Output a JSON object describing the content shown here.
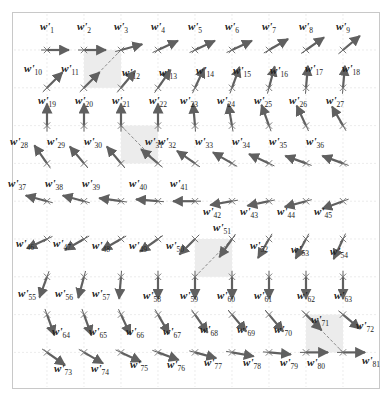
{
  "figure": {
    "colors": {
      "arrow": "#606060",
      "anchor": "#707070",
      "grid": "#e4e4e4",
      "frame": "#c8c8c8",
      "shade": "#ececec",
      "dashed": "#8a8a8a",
      "label": "#222222"
    },
    "grid": {
      "cols": 9,
      "rows": 9,
      "x0": 47,
      "y0": 50,
      "dx": 37,
      "dy": 37.8,
      "arrow_len": 22
    },
    "label_prefix": "w",
    "label_prime": "'",
    "row_angles_deg": [
      [
        0,
        0,
        -15,
        -25,
        -25,
        -25,
        -30,
        -35,
        -40
      ],
      [
        -45,
        -45,
        -50,
        -55,
        -65,
        -70,
        -75,
        -85,
        -85
      ],
      [
        -90,
        -90,
        -90,
        -90,
        -95,
        -100,
        -110,
        -115,
        -120
      ],
      [
        -125,
        -130,
        -130,
        -140,
        -145,
        -150,
        -155,
        -160,
        -160
      ],
      [
        -165,
        -165,
        -172,
        -175,
        180,
        170,
        168,
        165,
        160
      ],
      [
        155,
        150,
        150,
        145,
        135,
        125,
        120,
        118,
        115
      ],
      [
        110,
        105,
        95,
        90,
        90,
        90,
        90,
        90,
        90
      ],
      [
        70,
        70,
        65,
        60,
        55,
        50,
        50,
        45,
        40
      ],
      [
        35,
        30,
        25,
        20,
        15,
        10,
        5,
        0,
        0
      ]
    ],
    "label_offsets": [
      [
        [
          0,
          -20
        ],
        [
          0,
          -20
        ],
        [
          0,
          -20
        ],
        [
          0,
          -20
        ],
        [
          0,
          -20
        ],
        [
          0,
          -20
        ],
        [
          0,
          -20
        ],
        [
          0,
          -20
        ],
        [
          0,
          -20
        ]
      ],
      [
        [
          -14,
          -16
        ],
        [
          -14,
          -16
        ],
        [
          10,
          -12
        ],
        [
          10,
          -12
        ],
        [
          10,
          -14
        ],
        [
          10,
          -14
        ],
        [
          10,
          -14
        ],
        [
          8,
          -16
        ],
        [
          8,
          -16
        ]
      ],
      [
        [
          0,
          -22
        ],
        [
          0,
          -22
        ],
        [
          0,
          -22
        ],
        [
          0,
          -22
        ],
        [
          -6,
          -22
        ],
        [
          -6,
          -22
        ],
        [
          -6,
          -22
        ],
        [
          -8,
          -22
        ],
        [
          -8,
          -22
        ]
      ],
      [
        [
          -28,
          -18
        ],
        [
          -28,
          -18
        ],
        [
          -28,
          -18
        ],
        [
          -4,
          -18
        ],
        [
          -28,
          -18
        ],
        [
          -28,
          -18
        ],
        [
          -28,
          -18
        ],
        [
          -28,
          -18
        ],
        [
          -28,
          -18
        ]
      ],
      [
        [
          -30,
          -14
        ],
        [
          -30,
          -14
        ],
        [
          -30,
          -14
        ],
        [
          -20,
          -14
        ],
        [
          -16,
          -14
        ],
        [
          -20,
          14
        ],
        [
          -20,
          14
        ],
        [
          -20,
          14
        ],
        [
          -20,
          14
        ]
      ],
      [
        [
          -22,
          8
        ],
        [
          -22,
          8
        ],
        [
          -20,
          10
        ],
        [
          -20,
          10
        ],
        [
          -20,
          10
        ],
        [
          -10,
          -8
        ],
        [
          -10,
          10
        ],
        [
          -6,
          14
        ],
        [
          -4,
          16
        ]
      ],
      [
        [
          -20,
          20
        ],
        [
          -20,
          20
        ],
        [
          -20,
          20
        ],
        [
          -6,
          22
        ],
        [
          -6,
          22
        ],
        [
          -6,
          22
        ],
        [
          -6,
          22
        ],
        [
          0,
          22
        ],
        [
          0,
          22
        ]
      ],
      [
        [
          14,
          20
        ],
        [
          14,
          20
        ],
        [
          14,
          20
        ],
        [
          14,
          20
        ],
        [
          14,
          18
        ],
        [
          14,
          18
        ],
        [
          14,
          18
        ],
        [
          14,
          8
        ],
        [
          22,
          14
        ]
      ],
      [
        [
          16,
          20
        ],
        [
          16,
          20
        ],
        [
          18,
          16
        ],
        [
          18,
          16
        ],
        [
          18,
          14
        ],
        [
          20,
          14
        ],
        [
          20,
          14
        ],
        [
          10,
          14
        ],
        [
          28,
          12
        ]
      ]
    ],
    "shaded_cells": [
      {
        "col": 1,
        "row": 0,
        "diag": "up"
      },
      {
        "col": 2,
        "row": 2,
        "diag": "down"
      },
      {
        "col": 4,
        "row": 5,
        "diag": "up"
      },
      {
        "col": 7,
        "row": 7,
        "diag": "down"
      }
    ]
  }
}
